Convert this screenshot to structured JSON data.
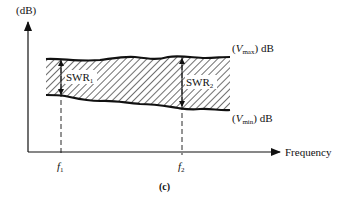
{
  "diagram": {
    "y_axis_label": "(dB)",
    "x_axis_label": "Frequency",
    "upper_curve_label": {
      "open": "(",
      "var": "V",
      "sub": "max",
      "close": ") dB"
    },
    "lower_curve_label": {
      "open": "(",
      "var": "V",
      "sub": "min",
      "close": ") dB"
    },
    "swr_labels": [
      {
        "main": "SWR",
        "sub": "1"
      },
      {
        "main": "SWR",
        "sub": "2"
      }
    ],
    "x_ticks": [
      {
        "var": "f",
        "sub": "1"
      },
      {
        "var": "f",
        "sub": "2"
      }
    ],
    "caption": "(c)",
    "colors": {
      "line": "#111111",
      "hatch": "#222222",
      "background": "#ffffff"
    }
  }
}
